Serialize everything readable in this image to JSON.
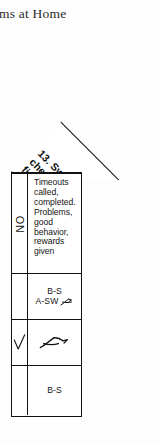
{
  "page": {
    "heading": "blems at Home"
  },
  "column_header": {
    "number": "13.",
    "lines": [
      "13. Swearing, lying,",
      "cheating, stealing,",
      "fire setting, violence"
    ],
    "full_text": "13. Swearing, lying, cheating, stealing, fire setting, violence",
    "rotation_degrees": "-45"
  },
  "table": {
    "rows": [
      {
        "mark_label": "NO",
        "mark_type": "vertical-text",
        "note_lines": [
          "Timeouts",
          "called,",
          "completed.",
          "Problems,",
          "good",
          "behavior,",
          "rewards",
          "given"
        ],
        "note_text": "Timeouts called, completed. Problems, good behavior, rewards given"
      },
      {
        "mark_label": "",
        "mark_type": "empty",
        "codes": [
          "B-S",
          "A-SW"
        ],
        "annotation": "handwritten-initial"
      },
      {
        "mark_label": "",
        "mark_type": "checkmark",
        "codes": [],
        "annotation": "handwritten-scribble"
      },
      {
        "mark_label": "",
        "mark_type": "empty",
        "codes": [
          "B-S"
        ],
        "annotation": ""
      }
    ]
  },
  "colors": {
    "ink": "#111111",
    "paper": "#fdfdfd",
    "text": "#151515"
  }
}
